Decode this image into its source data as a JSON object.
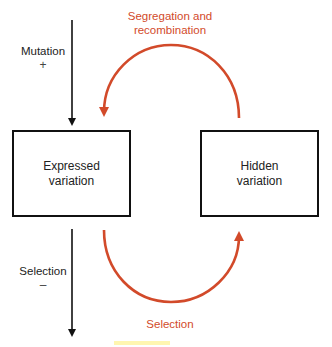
{
  "diagram": {
    "boxes": {
      "expressed": {
        "line1": "Expressed",
        "line2": "variation"
      },
      "hidden": {
        "line1": "Hidden",
        "line2": "variation"
      }
    },
    "arrows": {
      "mutation": {
        "label": "Mutation",
        "sign": "+"
      },
      "selection_down": {
        "label": "Selection",
        "sign": "–"
      },
      "top_arc": {
        "line1": "Segregation and",
        "line2": "recombination"
      },
      "bottom_arc": {
        "label": "Selection"
      }
    },
    "colors": {
      "arc": "#d24a2a",
      "arrow": "#111111",
      "box_border": "#111111",
      "highlight": "#fff6b0"
    }
  }
}
